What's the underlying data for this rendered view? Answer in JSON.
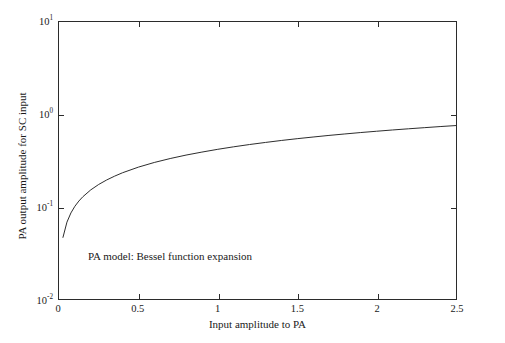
{
  "chart_data": {
    "type": "line",
    "title": "",
    "xlabel": "Input amplitude to PA",
    "ylabel": "PA output amplitude for SC input",
    "xlim": [
      0,
      2.5
    ],
    "ylim": [
      0.01,
      10
    ],
    "yscale": "log",
    "xscale": "linear",
    "grid": false,
    "legend": null,
    "annotations": [
      {
        "text": "PA model: Bessel function expansion",
        "x": 0.19,
        "y": 0.028
      }
    ],
    "xticks": [
      0,
      0.5,
      1,
      1.5,
      2,
      2.5
    ],
    "xtick_labels": [
      "0",
      "0.5",
      "1",
      "1.5",
      "2",
      "2.5"
    ],
    "yticks": [
      0.01,
      0.1,
      1,
      10
    ],
    "ytick_labels": [
      "10-2",
      "10-1",
      "100",
      "101"
    ],
    "ytick_mantissa": [
      "10",
      "10",
      "10",
      "10"
    ],
    "ytick_exponent": [
      "-2",
      "-1",
      "0",
      "1"
    ],
    "series": [
      {
        "name": "PA output amplitude",
        "color": "#2b2b2b",
        "linewidth": 1,
        "x": [
          0.025,
          0.05,
          0.075,
          0.1,
          0.125,
          0.15,
          0.2,
          0.25,
          0.3,
          0.35,
          0.4,
          0.5,
          0.6,
          0.7,
          0.8,
          0.9,
          1.0,
          1.1,
          1.2,
          1.3,
          1.4,
          1.5,
          1.6,
          1.7,
          1.8,
          1.9,
          2.0,
          2.1,
          2.2,
          2.3,
          2.4,
          2.5
        ],
        "y": [
          0.0465,
          0.068,
          0.0855,
          0.101,
          0.115,
          0.128,
          0.152,
          0.174,
          0.1945,
          0.214,
          0.233,
          0.268,
          0.301,
          0.332,
          0.362,
          0.39,
          0.418,
          0.445,
          0.471,
          0.496,
          0.521,
          0.545,
          0.568,
          0.591,
          0.613,
          0.635,
          0.656,
          0.677,
          0.697,
          0.717,
          0.737,
          0.756
        ]
      }
    ]
  },
  "annotation": {
    "model_note": "PA model: Bessel function expansion"
  },
  "axes": {
    "x_title": "Input amplitude to PA",
    "y_title": "PA output amplitude for SC input"
  }
}
